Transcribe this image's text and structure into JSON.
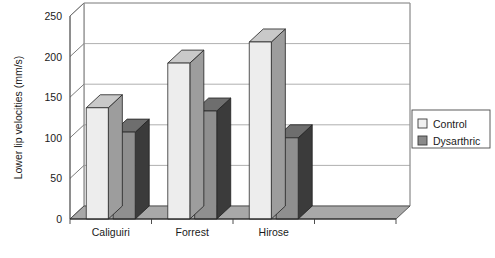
{
  "chart_data": {
    "type": "bar",
    "title": "",
    "subtitle": "",
    "xlabel": "",
    "ylabel": "Lower lip velocities (mm/s)",
    "categories": [
      "Caliguiri",
      "Forrest",
      "Hirose",
      ""
    ],
    "series": [
      {
        "name": "Control",
        "values": [
          137,
          192,
          218,
          0
        ],
        "color": "#e8e8e8"
      },
      {
        "name": "Dysarthric",
        "values": [
          107,
          133,
          100,
          0
        ],
        "color": "#8a8a8a"
      }
    ],
    "ylim": [
      0,
      250
    ],
    "yticks": [
      0,
      50,
      100,
      150,
      200,
      250
    ],
    "ytick_labels": [
      "0",
      "50",
      "100",
      "150",
      "200",
      "250"
    ],
    "grid": true,
    "grid_axis": "y",
    "legend": {
      "position": "right",
      "border": true,
      "entries": [
        {
          "label": "Control",
          "swatch_color": "#f0f0f0"
        },
        {
          "label": "Dysarthric",
          "swatch_color": "#8a8a8a"
        }
      ]
    },
    "style": {
      "three_d": true,
      "plot_background": "#ffffff",
      "axis_color": "#000000",
      "grid_color": "#9a9a9a",
      "floor_color": "#a8a8a8",
      "control_face": "#ededed",
      "control_top": "#c9c9c9",
      "control_side": "#9d9d9d",
      "dysarthric_face": "#8f8f8f",
      "dysarthric_top": "#6e6e6e",
      "dysarthric_side": "#3b3b3b"
    }
  }
}
